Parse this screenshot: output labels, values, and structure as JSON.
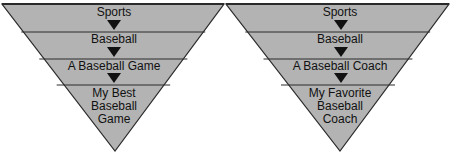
{
  "colors": {
    "fill": "#b3b3b3",
    "stroke": "#2a2a2a",
    "text": "#111111",
    "arrow": "#111111"
  },
  "funnels": [
    {
      "name": "funnel-left",
      "levels": [
        {
          "label": "Sports"
        },
        {
          "label": "Baseball"
        },
        {
          "label": "A Baseball Game"
        },
        {
          "label": "My Best",
          "label2": "Baseball",
          "label3": "Game"
        }
      ]
    },
    {
      "name": "funnel-right",
      "levels": [
        {
          "label": "Sports"
        },
        {
          "label": "Baseball"
        },
        {
          "label": "A Baseball Coach"
        },
        {
          "label": "My Favorite",
          "label2": "Baseball",
          "label3": "Coach"
        }
      ]
    }
  ]
}
